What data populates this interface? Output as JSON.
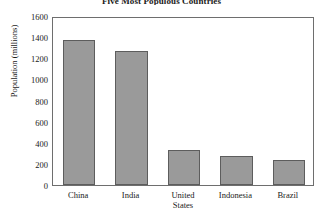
{
  "chart_data": {
    "type": "bar",
    "title": "Five Most Populous Countries",
    "xlabel": "",
    "ylabel": "Population (millions)",
    "categories": [
      "China",
      "India",
      "United States",
      "Indonesia",
      "Brazil"
    ],
    "category_lines": [
      [
        "China"
      ],
      [
        "India"
      ],
      [
        "United",
        "States"
      ],
      [
        "Indonesia"
      ],
      [
        "Brazil"
      ]
    ],
    "values": [
      1370,
      1270,
      330,
      270,
      240
    ],
    "ylim": [
      0,
      1600
    ],
    "ytick_values": [
      1600,
      1400,
      1200,
      1000,
      800,
      600,
      400,
      200,
      0
    ],
    "ytick_labels": [
      "1600",
      "1400",
      "1200",
      "1000",
      "800",
      "600",
      "400",
      "200",
      "0"
    ],
    "grid": false,
    "legend": null,
    "bar_color": "#9a9a9a",
    "bar_edge_color": "#5d5d5d",
    "axis_color": "#6e6e6e",
    "text_color": "#1a1a1a"
  }
}
